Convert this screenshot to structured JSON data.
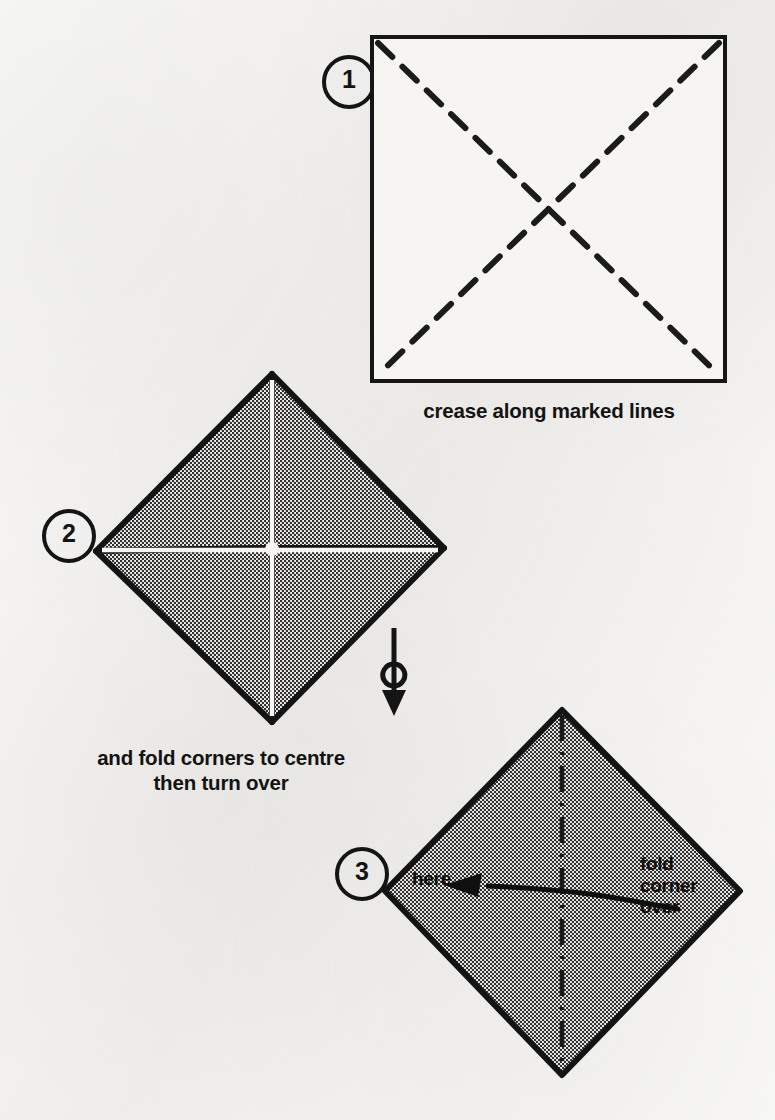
{
  "document": {
    "kind": "origami-folding-instructions",
    "background_color": "#f3f2ef",
    "ink_color": "#141414",
    "paper_fill_color": "#9a9a9a"
  },
  "steps": [
    {
      "number": "1",
      "badge_name": "step-1-badge",
      "shape": "square",
      "caption": "crease along marked lines",
      "crease_lines": [
        {
          "name": "diagonal-tl-br",
          "from": [
            0,
            0
          ],
          "to": [
            357,
            348
          ],
          "style": "dashed"
        },
        {
          "name": "diagonal-tr-bl",
          "from": [
            357,
            0
          ],
          "to": [
            0,
            348
          ],
          "style": "dashed"
        }
      ]
    },
    {
      "number": "2",
      "badge_name": "step-2-badge",
      "shape": "diamond",
      "caption": "and fold corners to centre\nthen turn over",
      "fold_marks": [
        "vertical-seam",
        "horizontal-seam"
      ],
      "turn_over_symbol": "turn-over-arrow"
    },
    {
      "number": "3",
      "badge_name": "step-3-badge",
      "shape": "diamond",
      "caption": "",
      "center_line_style": "dash-dot",
      "labels": {
        "target": "here",
        "instruction": "fold\ncorner\nover"
      },
      "arrow": {
        "name": "fold-corner-arrow",
        "direction": "left",
        "curved": true
      }
    }
  ]
}
